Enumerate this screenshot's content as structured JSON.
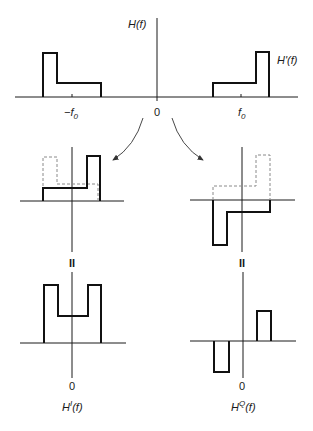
{
  "diagram": {
    "top": {
      "y_axis_label": "H(f)",
      "curve_label": "H'(f)",
      "x_ticks": {
        "neg": "−f",
        "zero": "0",
        "pos": "f",
        "subscript": "0"
      }
    },
    "middle": {
      "left_note": "shifted copies summed (in-phase)",
      "right_note": "shifted copies differenced (quadrature)"
    },
    "equals_sign": "II",
    "bottom": {
      "left": {
        "zero": "0",
        "label": "H",
        "sup": "I",
        "arg": "(f)"
      },
      "right": {
        "zero": "0",
        "label": "H",
        "sup": "Q",
        "arg": "(f)"
      }
    },
    "colors": {
      "solid": "#111111",
      "dashed": "#8a8a8a",
      "background": "#ffffff"
    }
  }
}
